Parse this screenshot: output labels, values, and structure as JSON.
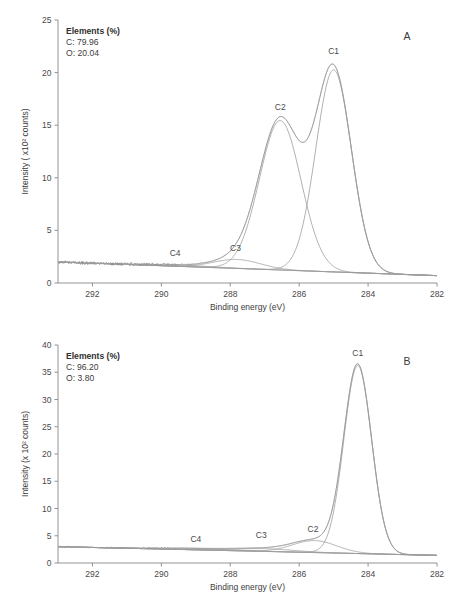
{
  "figure": {
    "panels": [
      {
        "id": "A",
        "letter": "A",
        "legend": {
          "title": "Elements (%)",
          "entries": [
            "C: 79.96",
            "O: 20.04"
          ]
        },
        "chart_data": {
          "type": "line",
          "title": "",
          "xlabel": "Binding energy (eV)",
          "ylabel": "Intensity ( x10² counts)",
          "xlim": [
            293,
            282
          ],
          "ylim": [
            0,
            25
          ],
          "xticks": [
            292,
            290,
            288,
            286,
            284,
            282
          ],
          "yticks": [
            0,
            5,
            10,
            15,
            20,
            25
          ],
          "xtick_labels": [
            "292",
            "290",
            "288",
            "286",
            "284",
            "282"
          ],
          "ytick_labels": [
            "0",
            "5",
            "10",
            "15",
            "20",
            "25"
          ],
          "x_axis_reversed": true,
          "grid": false,
          "legend_position": "upper-left",
          "annotations": [
            {
              "label": "C1",
              "x": 285.0,
              "y": 21.8
            },
            {
              "label": "C2",
              "x": 286.55,
              "y": 16.4
            },
            {
              "label": "C3",
              "x": 287.85,
              "y": 3.0
            },
            {
              "label": "C4",
              "x": 289.6,
              "y": 2.6
            }
          ],
          "series": [
            {
              "name": "C1",
              "type": "component-peak",
              "center": 285.0,
              "amplitude": 19.2,
              "fwhm": 1.22,
              "baseline_at_center": 1.5
            },
            {
              "name": "C2",
              "type": "component-peak",
              "center": 286.55,
              "amplitude": 14.2,
              "fwhm": 1.42,
              "baseline_at_center": 1.62
            },
            {
              "name": "C3",
              "type": "component-peak",
              "center": 287.8,
              "amplitude": 0.85,
              "fwhm": 1.6,
              "baseline_at_center": 1.7
            },
            {
              "name": "C4",
              "type": "component-peak",
              "center": 289.5,
              "amplitude": 0.12,
              "fwhm": 2.2,
              "baseline_at_center": 1.85
            },
            {
              "name": "envelope",
              "type": "fit-envelope"
            },
            {
              "name": "background",
              "type": "baseline",
              "y_left": 2.0,
              "y_right": 0.7
            },
            {
              "name": "raw-data",
              "type": "measured",
              "noise": 0.12
            }
          ]
        }
      },
      {
        "id": "B",
        "letter": "B",
        "legend": {
          "title": "Elements (%)",
          "entries": [
            "C: 96.20",
            "O: 3.80"
          ]
        },
        "chart_data": {
          "type": "line",
          "title": "",
          "xlabel": "Binding energy (eV)",
          "ylabel": "Intensity (x 10² counts)",
          "xlim": [
            293,
            282
          ],
          "ylim": [
            0,
            40
          ],
          "xticks": [
            292,
            290,
            288,
            286,
            284,
            282
          ],
          "yticks": [
            0,
            5,
            10,
            15,
            20,
            25,
            30,
            35,
            40
          ],
          "xtick_labels": [
            "292",
            "290",
            "288",
            "286",
            "284",
            "282"
          ],
          "ytick_labels": [
            "0",
            "5",
            "10",
            "15",
            "20",
            "25",
            "30",
            "35",
            "40"
          ],
          "x_axis_reversed": true,
          "grid": false,
          "legend_position": "upper-left",
          "annotations": [
            {
              "label": "C1",
              "x": 284.3,
              "y": 38.0
            },
            {
              "label": "C2",
              "x": 285.6,
              "y": 5.6
            },
            {
              "label": "C3",
              "x": 287.1,
              "y": 4.6
            },
            {
              "label": "C4",
              "x": 289.0,
              "y": 3.8
            }
          ],
          "series": [
            {
              "name": "C1",
              "type": "component-peak",
              "center": 284.3,
              "amplitude": 34.5,
              "fwhm": 0.95,
              "baseline_at_center": 2.5
            },
            {
              "name": "C2",
              "type": "component-peak",
              "center": 285.55,
              "amplitude": 2.2,
              "fwhm": 1.5,
              "baseline_at_center": 2.7
            },
            {
              "name": "C3",
              "type": "component-peak",
              "center": 287.0,
              "amplitude": 0.5,
              "fwhm": 2.0,
              "baseline_at_center": 2.85
            },
            {
              "name": "C4",
              "type": "component-peak",
              "center": 289.0,
              "amplitude": 0.25,
              "fwhm": 2.4,
              "baseline_at_center": 2.95
            },
            {
              "name": "envelope",
              "type": "fit-envelope"
            },
            {
              "name": "background",
              "type": "baseline",
              "y_left": 3.0,
              "y_right": 1.4
            },
            {
              "name": "raw-data",
              "type": "measured",
              "noise": 0.1
            }
          ]
        }
      }
    ]
  }
}
